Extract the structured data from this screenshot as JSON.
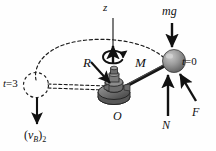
{
  "figure": {
    "background_color": "#fefefe",
    "ink_color": "#111111",
    "sphere_color": "#9a9a9a",
    "sphere_shadow_color": "#5e5e5e",
    "base_color": "#6f6f6f"
  },
  "labels": {
    "z_axis": "z",
    "weight": "mg",
    "time_initial": "t=0",
    "time_initial_var": "t",
    "time_initial_value": "=0",
    "moment": "M",
    "radius": "R",
    "origin": "O",
    "normal_force": "N",
    "applied_force": "F",
    "time_final": "t=3",
    "time_final_var": "t",
    "time_final_value": "=3",
    "velocity_var": "v",
    "velocity_sub": "B",
    "velocity_state": "2",
    "velocity_open": "(",
    "velocity_close": ")"
  },
  "icon_names": {
    "z_arrow": "up-arrow-icon",
    "mg_arrow": "down-arrow-icon",
    "N_arrow": "up-arrow-icon",
    "F_arrow": "diagonal-arrow-icon",
    "R_arrow": "diagonal-arrow-icon",
    "M_arrow": "curved-rotation-arrow-icon",
    "vB_arrow": "down-arrow-icon",
    "trajectory": "dashed-arc-icon",
    "ghost_sphere": "dashed-circle-icon"
  }
}
